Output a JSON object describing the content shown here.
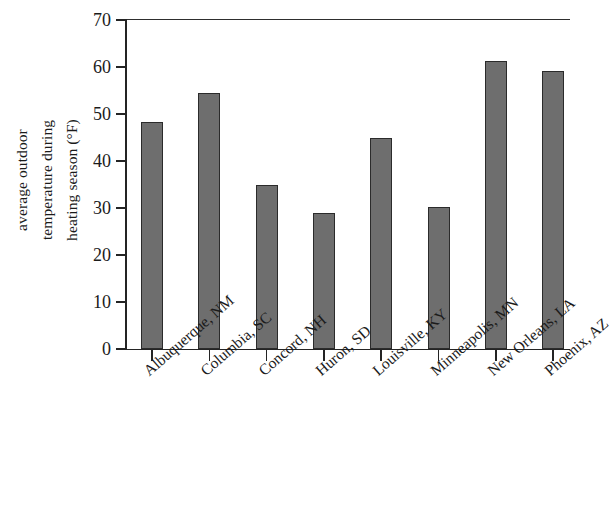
{
  "chart_data": {
    "type": "bar",
    "title": "",
    "subtitle": "",
    "xlabel": "",
    "ylabel": "average outdoor temperature during heating season (°F)",
    "ylabel_lines": [
      "average outdoor",
      "temperature during",
      "heating season (°F)"
    ],
    "categories": [
      "Albuquerque, NM",
      "Columbia, SC",
      "Concord, NH",
      "Huron, SD",
      "Louisville, KY",
      "Minneapolis, MN",
      "New Orleans, LA",
      "Phoenix, AZ"
    ],
    "values": [
      48.3,
      54.5,
      35.0,
      29.0,
      45.0,
      30.2,
      61.2,
      59.2
    ],
    "ylim": [
      0,
      70
    ],
    "yticks": [
      0,
      10,
      20,
      30,
      40,
      50,
      60,
      70
    ],
    "ytick_labels": [
      "0",
      "10",
      "20",
      "30",
      "40",
      "50",
      "60",
      "70"
    ],
    "grid": false,
    "legend": null,
    "bar_color": "#6e6e6e",
    "bar_edge_color": "#2b2b2b",
    "axis_color": "#242424",
    "background_color": "#ffffff"
  }
}
